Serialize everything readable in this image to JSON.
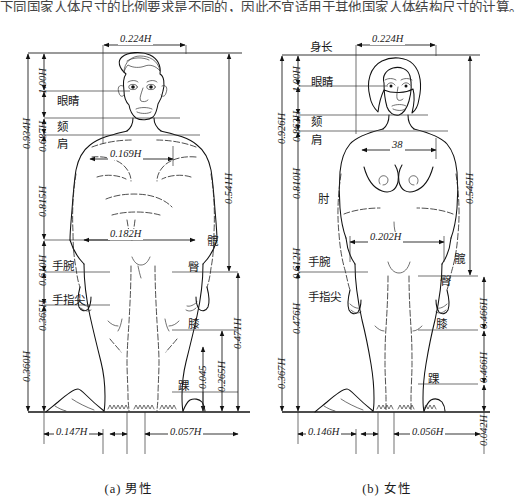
{
  "page": {
    "top_cut_text": "下同国家人体尺寸的比例要求是不同的，因此不宜适用于其他国家人体结构尺寸的计算。"
  },
  "figures": [
    {
      "id": "male",
      "caption": "(a) 男性",
      "top_width": "0.224H",
      "vertical_outer": [
        {
          "value": "0.934H"
        },
        {
          "value": "0.360H"
        }
      ],
      "vertical_left": [
        {
          "value": "1.00H"
        },
        {
          "value": "0.687H"
        },
        {
          "value": "0.815H"
        },
        {
          "value": "0.610H"
        },
        {
          "value": "0.365H"
        }
      ],
      "vertical_right": [
        {
          "value": "0.541H"
        },
        {
          "value": "0.471H"
        },
        {
          "value": "0.265H"
        },
        {
          "value": "0.045"
        }
      ],
      "body_labels_left": [
        {
          "text": "眼睛"
        },
        {
          "text": "颏"
        },
        {
          "text": "肩"
        },
        {
          "text": "手腕"
        },
        {
          "text": "手指尖"
        }
      ],
      "body_labels_right": [
        {
          "text": "髋"
        },
        {
          "text": "臀"
        },
        {
          "text": "膝"
        },
        {
          "text": "踝"
        }
      ],
      "width_dims": [
        {
          "value": "0.169H"
        },
        {
          "value": "0.182H"
        }
      ],
      "base_dims": [
        {
          "value": "0.147H"
        },
        {
          "value": "0.057H"
        }
      ]
    },
    {
      "id": "female",
      "caption": "(b) 女性",
      "top_width": "0.224H",
      "height_label": "身长",
      "vertical_outer": [
        {
          "value": "0.926H"
        },
        {
          "value": "0.367H"
        }
      ],
      "vertical_left": [
        {
          "value": "1.00H"
        },
        {
          "value": "0.862H"
        },
        {
          "value": "0.810H"
        },
        {
          "value": "0.612H"
        },
        {
          "value": "0.476H"
        }
      ],
      "vertical_right": [
        {
          "value": "0.545H"
        },
        {
          "value": "0.466H"
        },
        {
          "value": "0.466H"
        },
        {
          "value": "0.042H"
        }
      ],
      "body_labels_left": [
        {
          "text": "眼睛"
        },
        {
          "text": "颏"
        },
        {
          "text": "肩"
        },
        {
          "text": "肘"
        },
        {
          "text": "手腕"
        },
        {
          "text": "手指尖"
        }
      ],
      "body_labels_right": [
        {
          "text": "髋"
        },
        {
          "text": "臀"
        },
        {
          "text": "膝"
        },
        {
          "text": "踝"
        }
      ],
      "width_dims": [
        {
          "value": "38"
        },
        {
          "value": "0.202H"
        }
      ],
      "base_dims": [
        {
          "value": "0.146H"
        },
        {
          "value": "0.056H"
        }
      ]
    }
  ]
}
